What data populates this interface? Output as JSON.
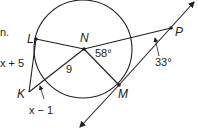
{
  "diagram": {
    "stray_text": "n.",
    "points": {
      "L": "L",
      "N": "N",
      "P": "P",
      "K": "K",
      "M": "M"
    },
    "measures": {
      "LK": "x + 5",
      "KM_segment": "x − 1",
      "NK": "9",
      "angle_N": "58°",
      "angle_P": "33°"
    },
    "colors": {
      "line": "#231f20",
      "background": "#ffffff"
    }
  }
}
